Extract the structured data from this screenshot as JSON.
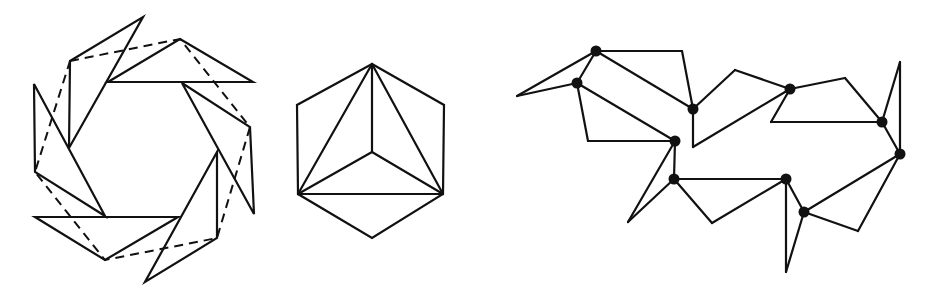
{
  "figures": [
    {
      "id": "pinwheel",
      "label": "Pinwheel of six triangles with dashed hexagon",
      "triangles": [
        [
          [
            70,
            61
          ],
          [
            143,
            17
          ],
          [
            69,
            148
          ]
        ],
        [
          [
            180,
            39
          ],
          [
            253,
            82
          ],
          [
            108,
            82
          ]
        ],
        [
          [
            182,
            83
          ],
          [
            250,
            127
          ],
          [
            254,
            214
          ]
        ],
        [
          [
            217,
            152
          ],
          [
            217,
            238
          ],
          [
            145,
            282
          ]
        ],
        [
          [
            178,
            217
          ],
          [
            35,
            217
          ],
          [
            105,
            260
          ]
        ],
        [
          [
            105,
            216
          ],
          [
            34,
            84
          ],
          [
            35,
            172
          ]
        ]
      ],
      "dashed_polygon": [
        [
          70,
          61
        ],
        [
          180,
          39
        ],
        [
          250,
          127
        ],
        [
          217,
          238
        ],
        [
          105,
          260
        ],
        [
          35,
          172
        ]
      ]
    },
    {
      "id": "hexagon",
      "label": "Hexagon with inscribed triangle and center spokes",
      "outline": [
        [
          372,
          64
        ],
        [
          444,
          105
        ],
        [
          443,
          194
        ],
        [
          372,
          238
        ],
        [
          298,
          194
        ],
        [
          297,
          105
        ]
      ],
      "segments": [
        [
          [
            372,
            64
          ],
          [
            298,
            194
          ]
        ],
        [
          [
            372,
            64
          ],
          [
            443,
            194
          ]
        ],
        [
          [
            298,
            194
          ],
          [
            443,
            194
          ]
        ],
        [
          [
            372,
            64
          ],
          [
            372,
            152
          ]
        ],
        [
          [
            298,
            194
          ],
          [
            372,
            152
          ]
        ],
        [
          [
            443,
            194
          ],
          [
            372,
            152
          ]
        ]
      ]
    },
    {
      "id": "chain",
      "label": "Chain of linked polygons with joint nodes",
      "nodes": [
        [
          596,
          51
        ],
        [
          577,
          83
        ],
        [
          693,
          109
        ],
        [
          675,
          141
        ],
        [
          674,
          179
        ],
        [
          790,
          89
        ],
        [
          882,
          122
        ],
        [
          900,
          154
        ],
        [
          786,
          179
        ],
        [
          804,
          212
        ]
      ],
      "segments": [
        [
          [
            596,
            51
          ],
          [
            682,
            51
          ]
        ],
        [
          [
            682,
            51
          ],
          [
            693,
            109
          ]
        ],
        [
          [
            596,
            51
          ],
          [
            693,
            109
          ]
        ],
        [
          [
            596,
            51
          ],
          [
            577,
            83
          ]
        ],
        [
          [
            596,
            51
          ],
          [
            517,
            96
          ]
        ],
        [
          [
            517,
            96
          ],
          [
            577,
            83
          ]
        ],
        [
          [
            577,
            83
          ],
          [
            675,
            141
          ]
        ],
        [
          [
            577,
            83
          ],
          [
            588,
            141
          ]
        ],
        [
          [
            588,
            141
          ],
          [
            675,
            141
          ]
        ],
        [
          [
            675,
            141
          ],
          [
            674,
            179
          ]
        ],
        [
          [
            675,
            141
          ],
          [
            628,
            222
          ]
        ],
        [
          [
            628,
            222
          ],
          [
            674,
            179
          ]
        ],
        [
          [
            693,
            109
          ],
          [
            735,
            70
          ]
        ],
        [
          [
            735,
            70
          ],
          [
            790,
            89
          ]
        ],
        [
          [
            693,
            109
          ],
          [
            693,
            147
          ]
        ],
        [
          [
            693,
            147
          ],
          [
            790,
            89
          ]
        ],
        [
          [
            790,
            89
          ],
          [
            771,
            122
          ]
        ],
        [
          [
            771,
            122
          ],
          [
            882,
            122
          ]
        ],
        [
          [
            790,
            89
          ],
          [
            845,
            78
          ]
        ],
        [
          [
            845,
            78
          ],
          [
            882,
            122
          ]
        ],
        [
          [
            882,
            122
          ],
          [
            900,
            62
          ]
        ],
        [
          [
            900,
            62
          ],
          [
            900,
            154
          ]
        ],
        [
          [
            882,
            122
          ],
          [
            900,
            154
          ]
        ],
        [
          [
            900,
            154
          ],
          [
            804,
            212
          ]
        ],
        [
          [
            900,
            154
          ],
          [
            858,
            231
          ]
        ],
        [
          [
            858,
            231
          ],
          [
            804,
            212
          ]
        ],
        [
          [
            786,
            179
          ],
          [
            804,
            212
          ]
        ],
        [
          [
            786,
            179
          ],
          [
            786,
            272
          ]
        ],
        [
          [
            786,
            272
          ],
          [
            804,
            212
          ]
        ],
        [
          [
            674,
            179
          ],
          [
            786,
            179
          ]
        ],
        [
          [
            674,
            179
          ],
          [
            712,
            223
          ]
        ],
        [
          [
            712,
            223
          ],
          [
            786,
            179
          ]
        ]
      ]
    }
  ],
  "colors": {
    "stroke": "#111111",
    "background": "#ffffff"
  }
}
